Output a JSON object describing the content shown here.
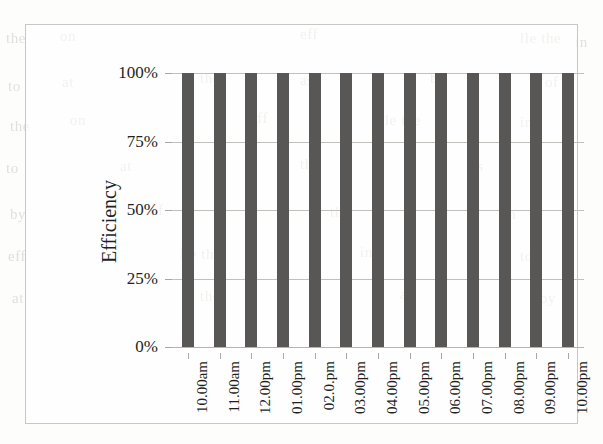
{
  "chart_data": {
    "type": "bar",
    "title": "",
    "xlabel": "",
    "ylabel": "Efficiency",
    "categories": [
      "10.00am",
      "11.00am",
      "12.00pm",
      "01.00pm",
      "02.0.pm",
      "03.00pm",
      "04.00pm",
      "05.00pm",
      "06.00pm",
      "07.00pm",
      "08.00pm",
      "09.00pm",
      "10.00pm"
    ],
    "values": [
      100,
      100,
      100,
      100,
      100,
      100,
      100,
      100,
      100,
      100,
      100,
      100,
      100
    ],
    "value_unit": "%",
    "ylim": [
      0,
      100
    ],
    "ytick_values": [
      0,
      25,
      50,
      75,
      100
    ],
    "ytick_labels": [
      "0%",
      "25%",
      "50%",
      "75%",
      "100%"
    ],
    "grid": true,
    "legend": false,
    "legend_position": "none",
    "bar_color": "#595755",
    "gridline_color": "#c2c0bd",
    "frame_color": "#c9c7c4",
    "text_color": "#231f1d",
    "background_color": "#fdfdfc"
  },
  "bleed_through": [
    "the",
    "on",
    "eff",
    "lle the",
    "in",
    "to",
    "at",
    "the",
    "as",
    "by",
    "of"
  ]
}
